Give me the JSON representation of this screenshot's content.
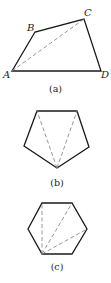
{
  "figures": [
    {
      "id": "a",
      "caption": "(a)",
      "shape": "quadrilateral",
      "vertices": [
        {
          "label": "A",
          "x": 12,
          "y": 71
        },
        {
          "label": "B",
          "x": 35,
          "y": 32
        },
        {
          "label": "C",
          "x": 84,
          "y": 19
        },
        {
          "label": "D",
          "x": 101,
          "y": 71
        }
      ],
      "diagonals": [
        [
          "A",
          "C"
        ]
      ]
    },
    {
      "id": "b",
      "caption": "(b)",
      "shape": "pentagon",
      "diagonals_from": "bottom vertex",
      "diagonal_count": 2
    },
    {
      "id": "c",
      "caption": "(c)",
      "shape": "hexagon",
      "diagonals_from": "bottom-left vertex",
      "diagonal_count": 3
    }
  ],
  "colors": {
    "stroke": "#1a1a1a",
    "dashed": "#8a8a8a",
    "background": "#ffffff"
  }
}
